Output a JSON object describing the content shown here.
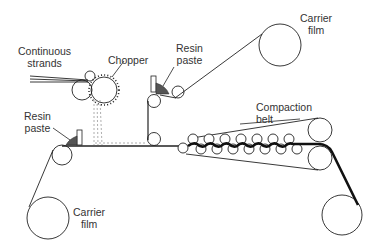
{
  "diagram": {
    "labels": {
      "continuous_strands": [
        "Continuous",
        "strands"
      ],
      "chopper": "Chopper",
      "resin_paste_top": [
        "Resin",
        "paste"
      ],
      "resin_paste_bottom": [
        "Resin",
        "paste"
      ],
      "carrier_film_top": [
        "Carrier",
        "film"
      ],
      "carrier_film_bottom": [
        "Carrier",
        "film"
      ],
      "compaction_belt": [
        "Compaction",
        "belt"
      ]
    },
    "colors": {
      "line": "#222222",
      "paste_fill": "#555555",
      "fiber_dash": "#999999",
      "text": "#333333"
    }
  }
}
